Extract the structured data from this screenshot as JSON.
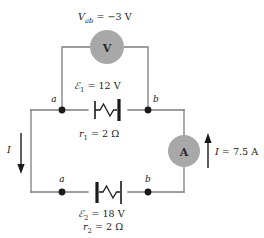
{
  "figure": {
    "colors": {
      "wire": "#7d7d7d",
      "component": "#1a1a1a",
      "meter_fill": "#a8a8a8",
      "text": "#1a1a1a",
      "background": "#ffffff"
    }
  },
  "annotations": {
    "terminal_voltage": {
      "symbol": "V",
      "subscript": "ab",
      "equals": "=",
      "value": "−3 V",
      "full": "Vab = −3 V"
    },
    "emf_top": {
      "symbol": "ℰ",
      "subscript": "1",
      "equals": "=",
      "value": "12 V",
      "full": "ℰ1 = 12 V"
    },
    "resistance_top": {
      "symbol": "r",
      "subscript": "1",
      "equals": "=",
      "value": "2 Ω",
      "full": "r1 = 2 Ω"
    },
    "emf_bottom": {
      "symbol": "ℰ",
      "subscript": "2",
      "equals": "=",
      "value": "18 V",
      "full": "ℰ2 = 18 V"
    },
    "resistance_bottom": {
      "symbol": "r",
      "subscript": "2",
      "equals": "=",
      "value": "2 Ω",
      "full": "r2 = 2 Ω"
    },
    "current_left": {
      "symbol": "I",
      "direction": "down"
    },
    "current_right": {
      "symbol": "I",
      "equals": "=",
      "value": "7.5 A",
      "direction": "up",
      "full": "I = 7.5 A"
    }
  },
  "meters": {
    "voltmeter": {
      "glyph": "V",
      "name": "voltmeter"
    },
    "ammeter": {
      "glyph": "A",
      "name": "ammeter"
    }
  },
  "nodes": {
    "top_left": "a",
    "top_right": "b",
    "bottom_left": "a",
    "bottom_right": "b"
  }
}
